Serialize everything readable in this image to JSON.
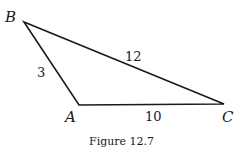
{
  "figure": {
    "caption": "Figure 12.7",
    "vertices": [
      {
        "name": "B",
        "x": 24,
        "y": 22
      },
      {
        "name": "A",
        "x": 79,
        "y": 105
      },
      {
        "name": "C",
        "x": 224,
        "y": 104
      }
    ],
    "sides": [
      {
        "name": "AB",
        "label": "3"
      },
      {
        "name": "BC",
        "label": "12"
      },
      {
        "name": "AC",
        "label": "10"
      }
    ],
    "labels": {
      "B": "B",
      "A": "A",
      "C": "C"
    },
    "stroke_color": "#1a1a1a"
  }
}
